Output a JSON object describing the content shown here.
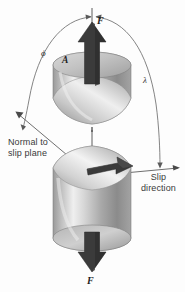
{
  "figure": {
    "background_color": "#fdfdfd",
    "labels": {
      "force_top": "F",
      "force_bottom": "F",
      "area": "A",
      "angle_phi": "ϕ",
      "angle_lambda": "λ",
      "normal_line1": "Normal to",
      "normal_line2": "slip plane",
      "slip_line1": "Slip",
      "slip_line2": "direction"
    },
    "colors": {
      "arrow_dark": "#3b3b3b",
      "arrow_dark_side": "#2a2a2a",
      "cylinder_light": "#f2f2f2",
      "cylinder_mid": "#b9b9b9",
      "cylinder_dark": "#7d7d7d",
      "line_gray": "#6b6b6b",
      "text_gray": "#3a3a3a",
      "axis_dash": "#4a4a4a"
    },
    "elements": {
      "top_cylinder": "upper-cylinder-half",
      "bottom_cylinder": "lower-cylinder-half",
      "slip_plane": "elliptical-slip-plane",
      "tensile_axis": "dashed-vertical-axis",
      "normal_vector": "normal-to-slip-plane-arrow",
      "slip_vector": "slip-direction-arrow",
      "shear_arrow": "in-plane-shear-arrow",
      "arc_phi": "angle-arc-phi",
      "arc_lambda": "angle-arc-lambda"
    }
  }
}
